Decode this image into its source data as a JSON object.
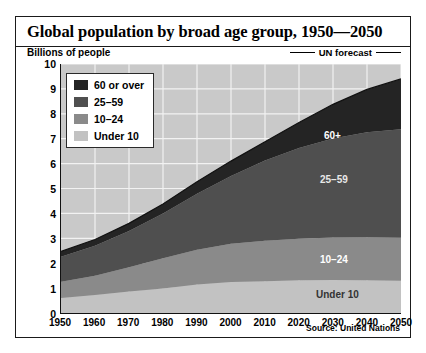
{
  "figure": {
    "title": "Global population by broad age group, 1950—2050",
    "axis_unit": "Billions of people",
    "forecast_note": "UN forecast",
    "source": "Source: United Nations"
  },
  "legend": {
    "items": [
      {
        "label": "60 or over",
        "color": "#242424"
      },
      {
        "label": "25–59",
        "color": "#4f4f4f"
      },
      {
        "label": "10–24",
        "color": "#8a8a8a"
      },
      {
        "label": "Under 10",
        "color": "#c2c2c2"
      }
    ]
  },
  "band_labels": {
    "over60": "60+",
    "mid": "25–59",
    "youth": "10–24",
    "under10": "Under 10"
  },
  "colors": {
    "plot_background": "#c9c9c9",
    "gridline": "#f2f2f2",
    "frame": "#1a1a1a",
    "band_over60": "#242424",
    "band_25_59": "#4f4f4f",
    "band_10_24": "#8a8a8a",
    "band_under10": "#c2c2c2"
  },
  "chart_data": {
    "type": "area",
    "stacked": true,
    "title": "Global population by broad age group, 1950—2050",
    "subtitle": "Billions of people",
    "xlabel": "",
    "ylabel": "Billions of people",
    "xlim": [
      1950,
      2050
    ],
    "ylim": [
      0,
      10
    ],
    "ytick_step": 1,
    "yticks": [
      0,
      1,
      2,
      3,
      4,
      5,
      6,
      7,
      8,
      9,
      10
    ],
    "x": [
      1950,
      1960,
      1970,
      1980,
      1990,
      2000,
      2010,
      2020,
      2030,
      2040,
      2050
    ],
    "xticks": [
      1950,
      1960,
      1970,
      1980,
      1990,
      2000,
      2010,
      2020,
      2030,
      2040,
      2050
    ],
    "grid": true,
    "grid_color": "#f2f2f2",
    "legend_position": "top-left",
    "annotations": [
      "60+",
      "25–59",
      "10–24",
      "Under 10",
      "UN forecast"
    ],
    "forecast_starts": 2010,
    "source": "Source: United Nations",
    "series": [
      {
        "name": "Under 10",
        "color": "#c2c2c2",
        "values": [
          0.6,
          0.72,
          0.86,
          0.98,
          1.14,
          1.25,
          1.28,
          1.32,
          1.33,
          1.32,
          1.3
        ]
      },
      {
        "name": "10–24",
        "color": "#8a8a8a",
        "values": [
          0.66,
          0.78,
          0.98,
          1.22,
          1.4,
          1.53,
          1.62,
          1.66,
          1.7,
          1.72,
          1.72
        ]
      },
      {
        "name": "25–59",
        "color": "#4f4f4f",
        "values": [
          1.0,
          1.2,
          1.45,
          1.8,
          2.25,
          2.72,
          3.22,
          3.65,
          3.98,
          4.22,
          4.36
        ]
      },
      {
        "name": "60 or over",
        "color": "#242424",
        "values": [
          0.21,
          0.25,
          0.31,
          0.38,
          0.48,
          0.6,
          0.76,
          1.02,
          1.37,
          1.72,
          2.02
        ]
      }
    ],
    "totals": [
      2.47,
      2.95,
      3.6,
      4.38,
      5.27,
      6.1,
      6.88,
      7.65,
      8.38,
      8.98,
      9.4
    ]
  }
}
